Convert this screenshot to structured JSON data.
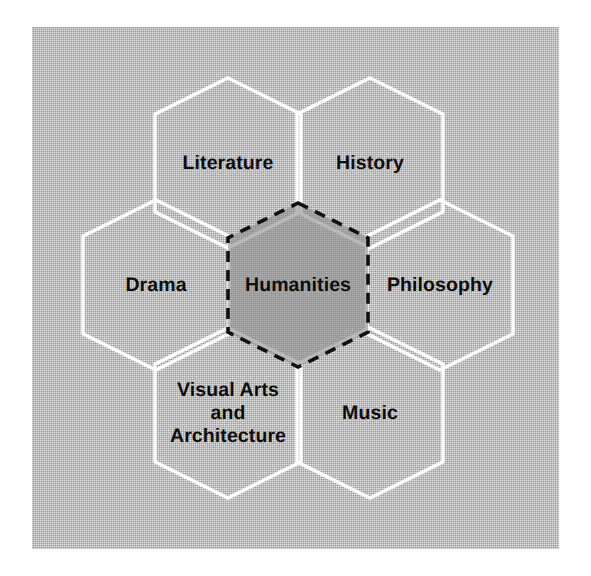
{
  "figure": {
    "name": "humanities-hexagon-diagram",
    "background_color": "#a9a9a9",
    "outline_color": "#ffffff",
    "center_fill_color": "#8e8e8e",
    "center_border_color": "#101010",
    "text_color": "#0c0c0c"
  },
  "center": {
    "label": "Humanities",
    "cx": 298,
    "cy": 285,
    "rx": 70,
    "ry": 82,
    "border_style": "dashed"
  },
  "cells": [
    {
      "id": "literature",
      "label": "Literature",
      "lines": [
        "Literature"
      ],
      "cx": 228,
      "cy": 163,
      "rx": 73,
      "ry": 85,
      "position": "top-left"
    },
    {
      "id": "history",
      "label": "History",
      "lines": [
        "History"
      ],
      "cx": 370,
      "cy": 163,
      "rx": 73,
      "ry": 85,
      "position": "top-right"
    },
    {
      "id": "drama",
      "label": "Drama",
      "lines": [
        "Drama"
      ],
      "cx": 156,
      "cy": 285,
      "rx": 73,
      "ry": 85,
      "position": "left"
    },
    {
      "id": "philosophy",
      "label": "Philosophy",
      "lines": [
        "Philosophy"
      ],
      "cx": 440,
      "cy": 285,
      "rx": 73,
      "ry": 85,
      "position": "right"
    },
    {
      "id": "visual-arts-and-architecture",
      "label": "Visual Arts and Architecture",
      "lines": [
        "Visual Arts",
        "and",
        "Architecture"
      ],
      "cx": 228,
      "cy": 413,
      "rx": 73,
      "ry": 85,
      "position": "bottom-left"
    },
    {
      "id": "music",
      "label": "Music",
      "lines": [
        "Music"
      ],
      "cx": 370,
      "cy": 413,
      "rx": 73,
      "ry": 85,
      "position": "bottom-right"
    }
  ]
}
